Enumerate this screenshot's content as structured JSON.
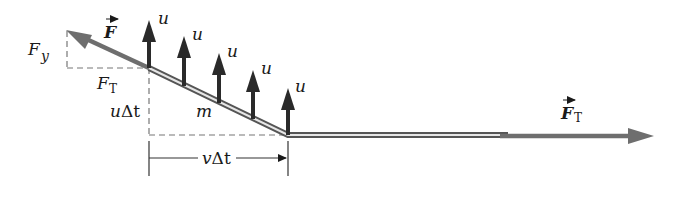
{
  "diagram": {
    "colors": {
      "force_arrow": "#6e6e6e",
      "velocity_arrow": "#2a2a2a",
      "string_outer": "#555555",
      "string_inner": "#e6e6e6",
      "dashed": "#777777",
      "text": "#1a1a1a"
    },
    "labels": {
      "force": "F",
      "force_y": "F",
      "force_y_sub": "y",
      "tension_component": "F",
      "tension_component_sub": "T",
      "vertical_displacement_u": "u",
      "vertical_displacement_delta_t": "Δt",
      "mass": "m",
      "horizontal_v": "v",
      "horizontal_delta_t": "Δt",
      "tension_right": "F",
      "tension_right_sub": "T"
    },
    "velocity_arrows": [
      {
        "label": "u",
        "x": 149,
        "base_y": 68,
        "tip_y": 20
      },
      {
        "label": "u",
        "x": 184,
        "base_y": 86,
        "tip_y": 36
      },
      {
        "label": "u",
        "x": 219,
        "base_y": 103,
        "tip_y": 53
      },
      {
        "label": "u",
        "x": 253,
        "base_y": 119,
        "tip_y": 70
      },
      {
        "label": "u",
        "x": 288,
        "base_y": 135,
        "tip_y": 88
      }
    ]
  }
}
